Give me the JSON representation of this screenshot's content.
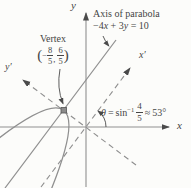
{
  "colors": {
    "background": "#fcfcfa",
    "line_gray": "#8f8f8f",
    "ink_dark": "#474747"
  },
  "axis_note": {
    "title": "Axis of parabola",
    "equation": {
      "p1": "−4",
      "v1": "x",
      "p2": " + 3",
      "v2": "y",
      "p3": " = 10"
    }
  },
  "vertex_label": {
    "title": "Vertex",
    "open_paren": "(",
    "minus": "−",
    "frac1": {
      "num": "8",
      "den": "5"
    },
    "comma": ",",
    "frac2": {
      "num": "6",
      "den": "5"
    },
    "close_paren": ")"
  },
  "angle_label": {
    "theta": "θ",
    "equals": "=",
    "func": "sin",
    "sup": "−1",
    "frac": {
      "num": "4",
      "den": "5"
    },
    "approx": "≈",
    "value": "53°"
  },
  "axes": {
    "x": "x",
    "y": "y",
    "x_prime": "x′",
    "y_prime": "y′"
  }
}
